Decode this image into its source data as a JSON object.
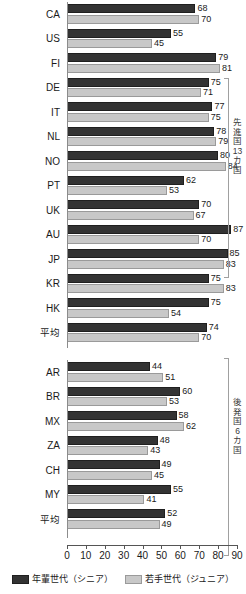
{
  "chart_data": {
    "type": "bar",
    "orientation": "horizontal",
    "title": "",
    "xlabel": "",
    "ylabel": "",
    "xlim": [
      0,
      90
    ],
    "xticks": [
      0,
      10,
      20,
      30,
      40,
      50,
      60,
      70,
      80,
      90
    ],
    "grid": false,
    "legend_position": "bottom",
    "series": [
      {
        "name": "年輩世代（シニア）",
        "color": "#333333",
        "key": "senior"
      },
      {
        "name": "若手世代（ジュニア）",
        "color": "#c8c8c8",
        "key": "junior"
      }
    ],
    "groups": [
      {
        "id": "developed",
        "bracket_label": "先進国13カ国",
        "bracket_label_chars": [
          "先",
          "進",
          "国",
          "13",
          "カ",
          "国"
        ],
        "categories": [
          "CA",
          "US",
          "FI",
          "DE",
          "IT",
          "NL",
          "NO",
          "PT",
          "UK",
          "AU",
          "JP",
          "KR",
          "HK",
          "平均"
        ],
        "senior": [
          68,
          55,
          79,
          75,
          77,
          78,
          80,
          62,
          70,
          87,
          85,
          75,
          75,
          74
        ],
        "junior": [
          70,
          45,
          81,
          71,
          75,
          79,
          84,
          53,
          67,
          70,
          83,
          83,
          54,
          70
        ]
      },
      {
        "id": "emerging",
        "bracket_label": "後発国6カ国",
        "bracket_label_chars": [
          "後",
          "発",
          "国",
          "6",
          "カ",
          "国"
        ],
        "categories": [
          "AR",
          "BR",
          "MX",
          "ZA",
          "CH",
          "MY",
          "平均"
        ],
        "senior": [
          44,
          60,
          58,
          48,
          49,
          55,
          52
        ],
        "junior": [
          51,
          53,
          62,
          43,
          45,
          41,
          49
        ]
      }
    ]
  }
}
